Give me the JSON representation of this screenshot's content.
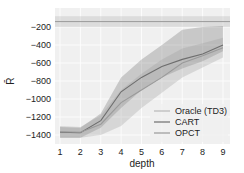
{
  "chart_data": {
    "type": "line",
    "title": "",
    "xlabel": "depth",
    "ylabel": "R̄",
    "x": [
      1,
      2,
      3,
      4,
      5,
      6,
      7,
      8,
      9
    ],
    "xticks": [
      "1",
      "2",
      "3",
      "4",
      "5",
      "6",
      "7",
      "8",
      "9"
    ],
    "yticks": [
      "-200",
      "-400",
      "-600",
      "-800",
      "-1000",
      "-1200",
      "-1400"
    ],
    "ytick_values": [
      -200,
      -400,
      -600,
      -800,
      -1000,
      -1200,
      -1400
    ],
    "ylim": [
      -1480,
      -50
    ],
    "xlim": [
      0.9,
      9.2
    ],
    "grid": true,
    "legend_position": "lower right",
    "series": [
      {
        "name": "Oracle (TD3)",
        "color": "#b8b8b8",
        "values": [
          -140,
          -140,
          -140,
          -140,
          -140,
          -140,
          -140,
          -140,
          -140
        ],
        "band_low": [
          -200,
          -200,
          -200,
          -200,
          -200,
          -200,
          -200,
          -200,
          -200
        ],
        "band_high": [
          -80,
          -80,
          -80,
          -80,
          -80,
          -80,
          -80,
          -80,
          -80
        ]
      },
      {
        "name": "CART",
        "color": "#6e6e6e",
        "values": [
          -1370,
          -1375,
          -1240,
          -920,
          -760,
          -640,
          -560,
          -500,
          -400
        ],
        "band_low": [
          -1430,
          -1430,
          -1320,
          -1100,
          -900,
          -760,
          -660,
          -580,
          -470
        ],
        "band_high": [
          -1310,
          -1320,
          -1160,
          -760,
          -560,
          -400,
          -230,
          -200,
          -190
        ]
      },
      {
        "name": "OPCT",
        "color": "#9a9a9a",
        "values": [
          -1365,
          -1370,
          -1280,
          -1040,
          -900,
          -760,
          -600,
          -520,
          -430
        ],
        "band_low": [
          -1430,
          -1430,
          -1400,
          -1300,
          -1100,
          -930,
          -760,
          -650,
          -540
        ],
        "band_high": [
          -1300,
          -1310,
          -1180,
          -900,
          -720,
          -560,
          -440,
          -380,
          -320
        ]
      }
    ]
  }
}
